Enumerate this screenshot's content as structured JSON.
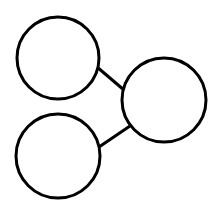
{
  "diagram": {
    "type": "share-graph",
    "background": "#ffffff",
    "stroke_color": "#000000",
    "stroke_width": 3,
    "nodes": [
      {
        "id": "top-left",
        "cx": 58,
        "cy": 58,
        "r": 41
      },
      {
        "id": "bottom-left",
        "cx": 58,
        "cy": 156,
        "r": 42
      },
      {
        "id": "right",
        "cx": 164,
        "cy": 100,
        "r": 42
      }
    ],
    "edges": [
      {
        "from": "top-left",
        "to": "right",
        "x1": 97,
        "y1": 67,
        "x2": 124,
        "y2": 90
      },
      {
        "from": "bottom-left",
        "to": "right",
        "x1": 99,
        "y1": 147,
        "x2": 130,
        "y2": 126
      }
    ]
  }
}
